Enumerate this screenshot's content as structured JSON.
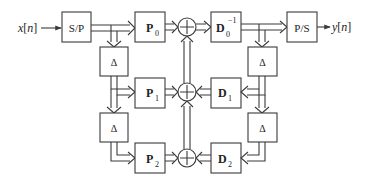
{
  "diagram": {
    "input_label": "x[n]",
    "input_var": "x",
    "input_idx": "n",
    "output_label": "y[n]",
    "output_var": "y",
    "output_idx": "n",
    "sp_label": "S/P",
    "ps_label": "P/S",
    "delay_label": "Δ",
    "p_blocks": [
      {
        "base": "P",
        "sub": "0"
      },
      {
        "base": "P",
        "sub": "1"
      },
      {
        "base": "P",
        "sub": "2"
      }
    ],
    "d_blocks": [
      {
        "base": "D",
        "sub": "0",
        "sup": "−1"
      },
      {
        "base": "D",
        "sub": "1"
      },
      {
        "base": "D",
        "sub": "2"
      }
    ],
    "summer_symbol": "+"
  }
}
